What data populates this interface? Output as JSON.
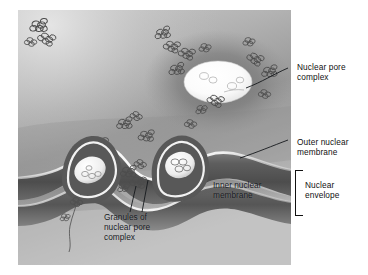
{
  "figure": {
    "kind": "scientific-illustration",
    "style": "grayscale airbrush rendering",
    "plate": {
      "left": 18,
      "top": 10,
      "width": 273,
      "height": 255,
      "background_tone": "#9a9a9a"
    }
  },
  "labels": [
    {
      "id": "nuclear-pore-complex",
      "text": "Nuclear pore\ncomplex",
      "x": 297,
      "y": 62,
      "color": "#111111",
      "leader": "line from face-on pore ellipse up-right to label"
    },
    {
      "id": "outer-nuclear-membrane",
      "text": "Outer nuclear\nmembrane",
      "x": 297,
      "y": 137,
      "color": "#111111",
      "leader": "diagonal line down-left to upper membrane surface"
    },
    {
      "id": "nuclear-envelope",
      "text": "Nuclear\nenvelope",
      "x": 305,
      "y": 180,
      "color": "#111111",
      "leader": "square bracket spanning both membranes"
    },
    {
      "id": "inner-nuclear-membrane",
      "text": "Inner nuclear\nmembrane",
      "x": 213,
      "y": 180,
      "color": "#15181c",
      "leader": "none (placed on membrane)"
    },
    {
      "id": "granules-of-nuclear-pore-complex",
      "text": "Granules of\nnuclear pore\ncomplex",
      "x": 104,
      "y": 212,
      "color": "#15181c",
      "leader": "two lines rising to granule clusters"
    }
  ],
  "colors": {
    "plate_light": "#c9c9c9",
    "plate_mid": "#9e9e9e",
    "plate_dark": "#6a6a6a",
    "membrane_highlight": "#efefef",
    "pore_white": "#fdfdfd",
    "granule_stroke": "#4a4a4a",
    "label_text": "#111111",
    "page_background": "#ffffff"
  },
  "structures": {
    "face_on_pore": {
      "cx": 218,
      "cy": 82,
      "rx": 33,
      "ry": 20
    },
    "cross_section_pores": [
      {
        "cx": 77,
        "cy": 186
      },
      {
        "cx": 175,
        "cy": 180
      }
    ],
    "granule_clusters": 11
  }
}
